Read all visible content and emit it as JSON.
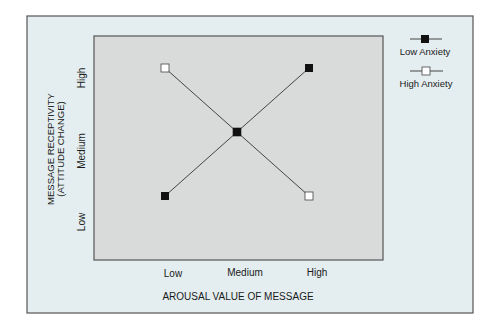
{
  "chart_data": {
    "type": "line",
    "title": "",
    "xlabel": "AROUSAL VALUE OF MESSAGE",
    "ylabel_lines": [
      "MESSAGE RECEPTIVITY",
      "(ATTITUDE CHANGE)"
    ],
    "categories": [
      "Low",
      "Medium",
      "High"
    ],
    "y_ticks": [
      "Low",
      "Medium",
      "High"
    ],
    "ylim": [
      0,
      2
    ],
    "grid": false,
    "legend_position": "top-right",
    "series": [
      {
        "name": "Low Anxiety",
        "marker": "filled-square",
        "x": [
          0,
          1,
          2
        ],
        "values": [
          0,
          1,
          2
        ]
      },
      {
        "name": "High Anxiety",
        "marker": "open-square",
        "x": [
          0,
          1,
          2
        ],
        "values": [
          2,
          1,
          0
        ]
      }
    ]
  },
  "colors": {
    "frame_background": "#e4eef0",
    "plot_background": "#d9dbdb",
    "frame_border": "#555555",
    "line": "#444444",
    "marker_filled": "#111111",
    "marker_open": "#ffffff"
  }
}
